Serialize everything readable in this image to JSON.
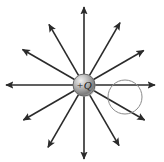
{
  "figure": {
    "background_color": "#ffffff",
    "width": 164,
    "height": 162
  },
  "charge": {
    "label": "+Q",
    "sign": "positive",
    "center_x": 84,
    "center_y": 85,
    "radius": 11,
    "fill_light": "#e8e8e8",
    "fill_mid": "#a8a8a8",
    "fill_dark": "#6e6e6e",
    "outline_color": "#555555"
  },
  "field_lines": {
    "count": 12,
    "color": "#2b2b2b",
    "stroke_width": 1.6,
    "arrowhead": "filled-triangle",
    "start_radius": 11,
    "angles_deg": [
      0,
      30,
      60,
      90,
      120,
      150,
      180,
      210,
      240,
      270,
      300,
      330
    ],
    "lengths": [
      71,
      69,
      72,
      78,
      70,
      71,
      78,
      70,
      72,
      74,
      70,
      70
    ]
  },
  "gaussian_surface": {
    "shape": "circle",
    "center_x": 125,
    "center_y": 97,
    "radius": 17,
    "stroke_color": "#8a8a8a",
    "stroke_width": 1,
    "fill": "none"
  }
}
